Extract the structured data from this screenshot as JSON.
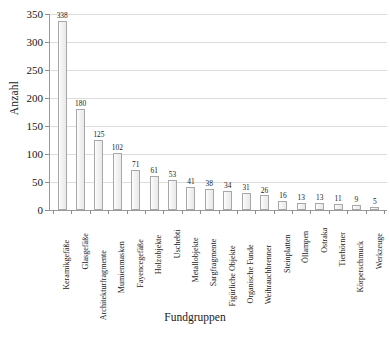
{
  "chart_data": {
    "type": "bar",
    "title": "",
    "xlabel": "Fundgruppen",
    "ylabel": "Anzahl",
    "ylim": [
      0,
      350
    ],
    "ytick_step": 50,
    "yticks": [
      0,
      50,
      100,
      150,
      200,
      250,
      300,
      350
    ],
    "grid": true,
    "legend": false,
    "categories": [
      "Keramikgefäße",
      "Glasgefäße",
      "Architekturfragmente",
      "Mumienmasken",
      "Fayencegefäße",
      "Holzobjekte",
      "Uschebti",
      "Metallobjekte",
      "Sargfragmente",
      "Figürliche Objekte",
      "Organische Funde",
      "Weihrauchbrenner",
      "Steinplatten",
      "Öllampen",
      "Ostraka",
      "Tierhörner",
      "Körperschmuck",
      "Werkzeuge"
    ],
    "values": [
      338,
      180,
      125,
      102,
      71,
      61,
      53,
      41,
      38,
      34,
      31,
      26,
      16,
      13,
      13,
      11,
      9,
      5
    ],
    "bar_fill": "#f1f1f1",
    "bar_border": "#a8a8a8",
    "grid_color": "#dcdcdc",
    "axis_color": "#9a9a9a"
  }
}
